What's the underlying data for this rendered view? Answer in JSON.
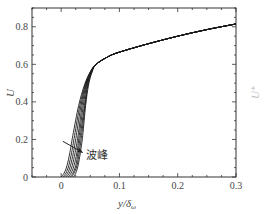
{
  "chart_data": {
    "type": "line",
    "title": "",
    "xlabel": "y/δ_ω",
    "ylabel": "U",
    "xlim": [
      -0.05,
      0.3
    ],
    "ylim": [
      0,
      0.9
    ],
    "xticks": [
      0,
      0.1,
      0.2,
      0.3
    ],
    "xtick_labels": [
      "0",
      "0.1",
      "0.2",
      "0.3"
    ],
    "yticks": [
      0,
      0.2,
      0.4,
      0.6,
      0.8
    ],
    "ytick_labels": [
      "0",
      "0.2",
      "0.4",
      "0.6",
      "0.8"
    ],
    "grid": false,
    "legend": null,
    "annotation": {
      "text": "波峰",
      "arrow": "points into curve family near y≈0.02, U≈0.15"
    },
    "series": [
      {
        "name": "profile-1",
        "x": [
          0.0,
          0.005,
          0.01,
          0.015,
          0.02,
          0.03,
          0.04,
          0.05,
          0.06,
          0.08,
          0.1,
          0.15,
          0.2,
          0.25,
          0.3
        ],
        "y": [
          0.0,
          0.02,
          0.06,
          0.13,
          0.22,
          0.38,
          0.49,
          0.56,
          0.6,
          0.64,
          0.665,
          0.71,
          0.75,
          0.785,
          0.815
        ]
      },
      {
        "name": "profile-2",
        "x": [
          0.003,
          0.008,
          0.013,
          0.018,
          0.023,
          0.032,
          0.041,
          0.05,
          0.06,
          0.08,
          0.1,
          0.15,
          0.2,
          0.25,
          0.3
        ],
        "y": [
          0.0,
          0.02,
          0.06,
          0.13,
          0.22,
          0.38,
          0.49,
          0.56,
          0.6,
          0.64,
          0.665,
          0.71,
          0.75,
          0.785,
          0.815
        ]
      },
      {
        "name": "profile-3",
        "x": [
          0.006,
          0.011,
          0.016,
          0.021,
          0.026,
          0.034,
          0.042,
          0.051,
          0.06,
          0.08,
          0.1,
          0.15,
          0.2,
          0.25,
          0.3
        ],
        "y": [
          0.0,
          0.02,
          0.06,
          0.13,
          0.22,
          0.38,
          0.49,
          0.56,
          0.6,
          0.64,
          0.665,
          0.71,
          0.75,
          0.785,
          0.815
        ]
      },
      {
        "name": "profile-4",
        "x": [
          0.009,
          0.014,
          0.019,
          0.024,
          0.029,
          0.036,
          0.043,
          0.051,
          0.06,
          0.08,
          0.1,
          0.15,
          0.2,
          0.25,
          0.3
        ],
        "y": [
          0.0,
          0.02,
          0.06,
          0.13,
          0.22,
          0.38,
          0.49,
          0.56,
          0.6,
          0.64,
          0.665,
          0.71,
          0.75,
          0.785,
          0.815
        ]
      },
      {
        "name": "profile-5",
        "x": [
          0.012,
          0.017,
          0.022,
          0.027,
          0.031,
          0.038,
          0.044,
          0.052,
          0.06,
          0.08,
          0.1,
          0.15,
          0.2,
          0.25,
          0.3
        ],
        "y": [
          0.0,
          0.02,
          0.06,
          0.13,
          0.22,
          0.38,
          0.49,
          0.56,
          0.6,
          0.64,
          0.665,
          0.71,
          0.75,
          0.785,
          0.815
        ]
      },
      {
        "name": "profile-6",
        "x": [
          0.015,
          0.02,
          0.025,
          0.029,
          0.033,
          0.04,
          0.045,
          0.052,
          0.06,
          0.08,
          0.1,
          0.15,
          0.2,
          0.25,
          0.3
        ],
        "y": [
          0.0,
          0.02,
          0.06,
          0.13,
          0.22,
          0.38,
          0.49,
          0.56,
          0.6,
          0.64,
          0.665,
          0.71,
          0.75,
          0.785,
          0.815
        ]
      },
      {
        "name": "profile-7",
        "x": [
          0.018,
          0.022,
          0.027,
          0.031,
          0.035,
          0.041,
          0.046,
          0.053,
          0.06,
          0.08,
          0.1,
          0.15,
          0.2,
          0.25,
          0.3
        ],
        "y": [
          0.0,
          0.02,
          0.06,
          0.13,
          0.22,
          0.38,
          0.49,
          0.56,
          0.6,
          0.64,
          0.665,
          0.71,
          0.75,
          0.785,
          0.815
        ]
      },
      {
        "name": "profile-8",
        "x": [
          0.021,
          0.025,
          0.029,
          0.033,
          0.037,
          0.042,
          0.047,
          0.053,
          0.06,
          0.08,
          0.1,
          0.15,
          0.2,
          0.25,
          0.3
        ],
        "y": [
          0.0,
          0.02,
          0.06,
          0.13,
          0.22,
          0.38,
          0.49,
          0.56,
          0.6,
          0.64,
          0.665,
          0.71,
          0.75,
          0.785,
          0.815
        ]
      }
    ]
  },
  "labels": {
    "xlabel_main": "y/δ",
    "xlabel_sub": "ω",
    "ylabel": "U",
    "annotation": "波峰",
    "clipped_right_ylabel": "U⁺"
  }
}
